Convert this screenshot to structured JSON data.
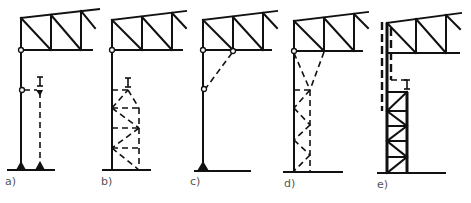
{
  "figure": {
    "line_color": "#111111",
    "background": "#ffffff",
    "panels": [
      {
        "id": "a",
        "label": "a)",
        "variant": "separate crane column with hinged strut, two pinned supports"
      },
      {
        "id": "b",
        "label": "b)",
        "variant": "column with attached dashed lattice crane support"
      },
      {
        "id": "c",
        "label": "c)",
        "variant": "column with dashed knee brace to truss bottom chord"
      },
      {
        "id": "d",
        "label": "d)",
        "variant": "column with tapered dashed lattice bracing to truss"
      },
      {
        "id": "e",
        "label": "e)",
        "variant": "built-up lattice column with dashed upper shaft"
      }
    ]
  }
}
